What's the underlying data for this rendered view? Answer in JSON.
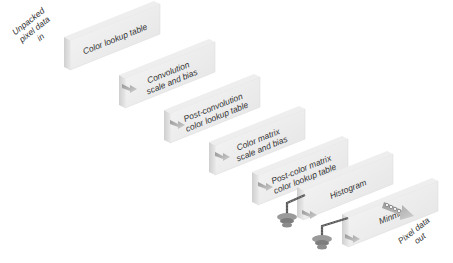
{
  "diagram": {
    "input_label": [
      "Unpacked",
      "pixel data",
      "in"
    ],
    "output_label": [
      "Pixel data",
      "out"
    ],
    "stages": [
      {
        "id": "color-lookup-table",
        "lines": [
          "Color lookup table"
        ]
      },
      {
        "id": "convolution-scale-bias",
        "lines": [
          "Convolution",
          "scale and bias"
        ]
      },
      {
        "id": "post-convolution-color-lookup-table",
        "lines": [
          "Post-convolution",
          "color lookup table"
        ]
      },
      {
        "id": "color-matrix-scale-bias",
        "lines": [
          "Color matrix",
          "scale and bias"
        ]
      },
      {
        "id": "post-color-matrix-color-lookup-table",
        "lines": [
          "Post-color matrix",
          "color lookup table"
        ]
      },
      {
        "id": "histogram",
        "lines": [
          "Histogram"
        ]
      },
      {
        "id": "minmax",
        "lines": [
          "Minmax"
        ]
      }
    ],
    "taps": [
      "histogram",
      "minmax"
    ]
  }
}
